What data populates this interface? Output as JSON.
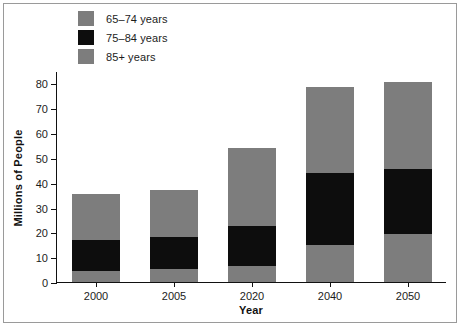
{
  "chart_data": {
    "type": "bar",
    "stacked": true,
    "title": "",
    "subtitle": "",
    "xlabel": "Year",
    "ylabel": "Millions of People",
    "categories": [
      "2000",
      "2005",
      "2020",
      "2040",
      "2050"
    ],
    "yticks": [
      0,
      10,
      20,
      30,
      40,
      50,
      60,
      70,
      80
    ],
    "ytick_labels": [
      "0",
      "10",
      "20",
      "30",
      "40",
      "50",
      "60",
      "70",
      "80"
    ],
    "ylim": [
      0,
      85
    ],
    "grid": false,
    "legend_position": "top-left",
    "series": [
      {
        "name": "85+ years",
        "color": "#7d7d7d",
        "values": [
          4.5,
          5.2,
          6.5,
          15.0,
          19.5
        ]
      },
      {
        "name": "75–84 years",
        "color": "#0d0d0d",
        "values": [
          12.5,
          12.8,
          16.0,
          29.0,
          26.0
        ]
      },
      {
        "name": "65–74 years",
        "color": "#7d7d7d",
        "values": [
          18.5,
          19.0,
          31.5,
          34.5,
          35.0
        ]
      }
    ],
    "totals": [
      35.5,
      37.0,
      54.0,
      78.5,
      80.5
    ],
    "annotations": []
  },
  "legend": {
    "items": [
      {
        "label": "65–74 years",
        "color": "#7d7d7d",
        "swatch_name": "legend-swatch-65-74"
      },
      {
        "label": "75–84 years",
        "color": "#0d0d0d",
        "swatch_name": "legend-swatch-75-84"
      },
      {
        "label": "85+ years",
        "color": "#7d7d7d",
        "swatch_name": "legend-swatch-85-plus"
      }
    ]
  },
  "axes": {
    "y_title": "Millions of People",
    "x_title": "Year"
  },
  "colors": {
    "bar_gray": "#7d7d7d",
    "bar_black": "#0d0d0d",
    "axis": "#111111",
    "text": "#1c1c1c",
    "frame": "#9a9a9a",
    "background": "#ffffff"
  }
}
